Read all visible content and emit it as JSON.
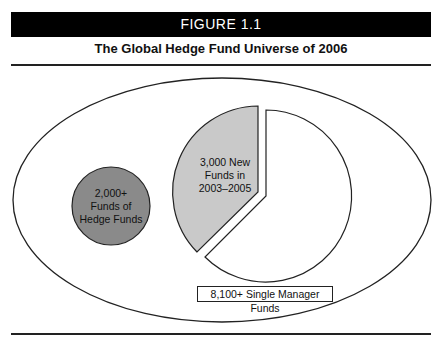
{
  "figure": {
    "label": "FIGURE 1.1",
    "title": "The Global Hedge Fund Universe of 2006"
  },
  "colors": {
    "header_bg": "#000000",
    "funds_of_funds_fill": "#8a8a8a",
    "new_funds_fill": "#c9c9c9",
    "single_manager_fill": "#ffffff"
  },
  "diagram": {
    "outer": "Global Hedge Fund Universe",
    "funds_of_funds": {
      "line1": "2,000+",
      "line2": "Funds of",
      "line3": "Hedge Funds"
    },
    "new_funds": {
      "line1": "3,000 New",
      "line2": "Funds in",
      "line3": "2003–2005"
    },
    "single_manager": {
      "label": "8,100+ Single Manager Funds"
    }
  }
}
